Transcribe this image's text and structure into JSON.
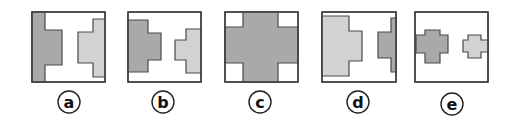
{
  "figure": {
    "colors": {
      "dark_fill": "#a9a9a9",
      "light_fill": "#d2d2d2",
      "stroke": "#4a4a4a",
      "frame": "#3a3a3a"
    },
    "options": [
      {
        "label": "a",
        "frame": {
          "x": 32,
          "y": 12,
          "w": 73,
          "h": 70
        },
        "shapes": [
          {
            "tone": "dark",
            "points": "32,12 45,12 45,30 62,30 62,65 45,65 45,82 32,82"
          },
          {
            "tone": "light",
            "points": "93,19 105,19 105,77 93,77 93,63 78,63 78,32 93,32"
          }
        ],
        "label_center": {
          "x": 69,
          "y": 102
        }
      },
      {
        "label": "b",
        "frame": {
          "x": 128,
          "y": 12,
          "w": 73,
          "h": 70
        },
        "shapes": [
          {
            "tone": "dark",
            "points": "128,20 148,20 148,33 161,33 161,60 148,60 148,72 128,72"
          },
          {
            "tone": "light",
            "points": "186,29 201,29 201,73 186,73 186,60 175,60 175,40 186,40"
          }
        ],
        "label_center": {
          "x": 163,
          "y": 102
        }
      },
      {
        "label": "c",
        "frame": {
          "x": 225,
          "y": 12,
          "w": 73,
          "h": 70
        },
        "shapes": [
          {
            "tone": "dark",
            "points": "243,12 278,12 278,27 298,27 298,63 278,63 278,82 243,82 243,63 225,63 225,27 243,27"
          }
        ],
        "label_center": {
          "x": 260,
          "y": 102
        }
      },
      {
        "label": "d",
        "frame": {
          "x": 322,
          "y": 12,
          "w": 74,
          "h": 70
        },
        "shapes": [
          {
            "tone": "light",
            "points": "322,16 349,16 349,31 362,31 362,61 349,61 349,76 322,76"
          },
          {
            "tone": "dark",
            "points": "391,18 396,18 396,72 391,72 391,58 378,58 378,32 391,32"
          }
        ],
        "label_center": {
          "x": 358,
          "y": 102
        }
      },
      {
        "label": "e",
        "frame": {
          "x": 415,
          "y": 12,
          "w": 73,
          "h": 70
        },
        "shapes": [
          {
            "tone": "dark",
            "points": "425,30 440,30 440,35 448,35 448,53 440,53 440,63 425,63 425,53 416,53 416,35 425,35"
          },
          {
            "tone": "light",
            "points": "468,35 481,35 481,40 488,40 488,52 481,52 481,58 468,58 468,52 463,52 463,40 468,40"
          }
        ],
        "label_center": {
          "x": 452,
          "y": 104
        }
      }
    ]
  }
}
